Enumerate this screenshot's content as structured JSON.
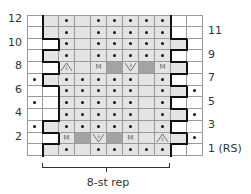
{
  "chart_data": {
    "type": "table",
    "columns": 11,
    "rows": 12,
    "row_labels_left": [
      "12",
      "10",
      "8",
      "6",
      "4",
      "2"
    ],
    "row_labels_right": [
      "11",
      "9",
      "7",
      "5",
      "3",
      "1 (RS)"
    ],
    "repeat_label": "8-st rep",
    "legend_codes": {
      "w": "white empty (knit, edge)",
      "g": "light grey empty",
      "gd": "light grey with dot (purl)",
      "wd": "white with dot (purl)",
      "D": "dark grey (no stitch)",
      "M": "M (make one)",
      "dec5": "5-st decrease (up triangle)",
      "inc3": "3-st increase (down V)"
    },
    "grid_top_to_bottom": {
      "12": [
        "w",
        "g",
        "gd",
        "g",
        "gd",
        "gd",
        "gd",
        "gd",
        "gd",
        "w",
        "w"
      ],
      "11": [
        "w",
        "g",
        "gd",
        "g",
        "gd",
        "gd",
        "gd",
        "gd",
        "gd",
        "w",
        "w"
      ],
      "10": [
        "w",
        "w",
        "gd",
        "g",
        "gd",
        "gd",
        "gd",
        "gd",
        "gd",
        "g",
        "w"
      ],
      "9": [
        "w",
        "g",
        "gd",
        "g",
        "gd",
        "gd",
        "gd",
        "gd",
        "gd",
        "w",
        "w"
      ],
      "8": [
        "w",
        "w",
        "dec5",
        "g",
        "M",
        "D",
        "inc3",
        "D",
        "M",
        "g",
        "w"
      ],
      "7": [
        "wd",
        "g",
        "gd",
        "gd",
        "gd",
        "gd",
        "gd",
        "g",
        "gd",
        "w",
        "w"
      ],
      "6": [
        "w",
        "w",
        "gd",
        "gd",
        "gd",
        "gd",
        "gd",
        "g",
        "gd",
        "g",
        "wd"
      ],
      "5": [
        "wd",
        "w",
        "gd",
        "gd",
        "gd",
        "gd",
        "gd",
        "g",
        "gd",
        "w",
        "w"
      ],
      "4": [
        "w",
        "w",
        "gd",
        "gd",
        "gd",
        "gd",
        "gd",
        "g",
        "gd",
        "g",
        "wd"
      ],
      "3": [
        "wd",
        "g",
        "gd",
        "gd",
        "gd",
        "gd",
        "gd",
        "g",
        "gd",
        "w",
        "w"
      ],
      "2": [
        "w",
        "w",
        "M",
        "D",
        "inc3",
        "D",
        "M",
        "g",
        "dec5",
        "g",
        "wd"
      ],
      "1": [
        "w",
        "g",
        "gd",
        "g",
        "gd",
        "gd",
        "gd",
        "gd",
        "gd",
        "w",
        "w"
      ]
    },
    "symbol_text": {
      "M": "M",
      "dec5": "5",
      "inc3": "3"
    }
  },
  "labels": {
    "left": [
      "12",
      "10",
      "8",
      "6",
      "4",
      "2"
    ],
    "right": [
      "11",
      "9",
      "7",
      "5",
      "3",
      "1 (RS)"
    ],
    "repeat": "8-st rep"
  },
  "colors": {
    "white": "#ffffff",
    "light_grey": "#e4e4e4",
    "dark_grey": "#a3a3a3",
    "grid_line": "#9a9a9a",
    "outline": "#111111"
  }
}
